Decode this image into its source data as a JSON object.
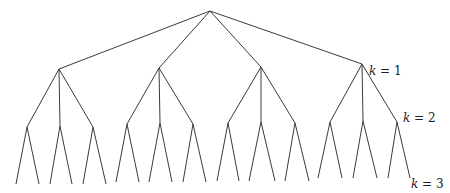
{
  "diagram": {
    "type": "tree",
    "branching": [
      4,
      3,
      2
    ],
    "nodes": {
      "root": [
        210,
        11
      ],
      "level1": [
        [
          59,
          69
        ],
        [
          159,
          68
        ],
        [
          261,
          67
        ],
        [
          362,
          64
        ]
      ],
      "level2": [
        [
          [
            27,
            127
          ],
          [
            60,
            126
          ],
          [
            93,
            127
          ]
        ],
        [
          [
            127,
            124
          ],
          [
            160,
            123
          ],
          [
            193,
            124
          ]
        ],
        [
          [
            228,
            123
          ],
          [
            261,
            122
          ],
          [
            295,
            123
          ]
        ],
        [
          [
            330,
            122
          ],
          [
            363,
            121
          ],
          [
            397,
            122
          ]
        ]
      ],
      "level3": [
        [
          [
            [
              16,
              184
            ],
            [
              39,
              184
            ]
          ],
          [
            [
              50,
              184
            ],
            [
              72,
              184
            ]
          ],
          [
            [
              83,
              184
            ],
            [
              106,
              184
            ]
          ]
        ],
        [
          [
            [
              116,
              182
            ],
            [
              139,
              182
            ]
          ],
          [
            [
              149,
              182
            ],
            [
              172,
              182
            ]
          ],
          [
            [
              183,
              182
            ],
            [
              206,
              182
            ]
          ]
        ],
        [
          [
            [
              217,
              181
            ],
            [
              239,
              181
            ]
          ],
          [
            [
              249,
              181
            ],
            [
              275,
              181
            ]
          ],
          [
            [
              285,
              181
            ],
            [
              309,
              181
            ]
          ]
        ],
        [
          [
            [
              318,
              178
            ],
            [
              342,
              178
            ]
          ],
          [
            [
              353,
              178
            ],
            [
              377,
              178
            ]
          ],
          [
            [
              388,
              178
            ],
            [
              410,
              178
            ]
          ]
        ]
      ]
    },
    "labels": [
      {
        "var": "k",
        "eq": " = ",
        "value": "1",
        "x": 369,
        "y": 75
      },
      {
        "var": "k",
        "eq": " = ",
        "value": "2",
        "x": 403,
        "y": 122
      },
      {
        "var": "k",
        "eq": " = ",
        "value": "3",
        "x": 411,
        "y": 188
      }
    ]
  }
}
